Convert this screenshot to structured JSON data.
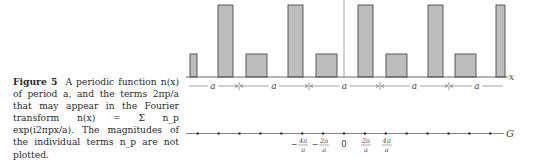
{
  "caption": {
    "figure_label": "Figure 5",
    "text": "A periodic function n(x) of period a, and the terms 2πp/a that may appear in the Fourier transform n(x) = Σ n_p exp(i2πpx/a). The magnitudes of the individual terms n_p are not plotted."
  },
  "upper_plot": {
    "axis_label": "x",
    "period_label": "a",
    "period_count": 5,
    "bar_fill": "#bdbdbd",
    "bar_stroke": "#4a4a4a",
    "bars": [
      {
        "x": 190,
        "w": 7,
        "h": "short"
      },
      {
        "x": 218,
        "w": 15,
        "h": "tall"
      },
      {
        "x": 246,
        "w": 21,
        "h": "short"
      },
      {
        "x": 288,
        "w": 15,
        "h": "tall"
      },
      {
        "x": 316,
        "w": 21,
        "h": "short"
      },
      {
        "x": 358,
        "w": 15,
        "h": "tall"
      },
      {
        "x": 386,
        "w": 21,
        "h": "short"
      },
      {
        "x": 428,
        "w": 15,
        "h": "tall"
      },
      {
        "x": 455,
        "w": 21,
        "h": "short"
      },
      {
        "x": 496,
        "w": 9,
        "h": "tall"
      }
    ]
  },
  "lower_plot": {
    "axis_label": "G",
    "tick_labels": [
      {
        "num": "4π",
        "den": "a",
        "sign": "−"
      },
      {
        "num": "2π",
        "den": "a",
        "sign": "−"
      },
      {
        "num": "0"
      },
      {
        "num": "2π",
        "den": "a",
        "sign": ""
      },
      {
        "num": "4π",
        "den": "a",
        "sign": ""
      }
    ],
    "dot_count": 15
  },
  "chart_data": {
    "type": "bar",
    "xlabel": "x",
    "ylabel": "n(x)",
    "period": "a",
    "series": [
      {
        "name": "tall bars (relative height)",
        "values": [
          1.0,
          1.0,
          1.0,
          1.0,
          1.0
        ]
      },
      {
        "name": "short bars (relative height)",
        "values": [
          0.31,
          0.31,
          0.31,
          0.31,
          0.31
        ]
      }
    ],
    "g_axis": {
      "label": "G",
      "ticks": [
        "−4π/a",
        "−2π/a",
        "0",
        "2π/a",
        "4π/a"
      ],
      "spacing": "2π/a"
    },
    "grid": false
  }
}
